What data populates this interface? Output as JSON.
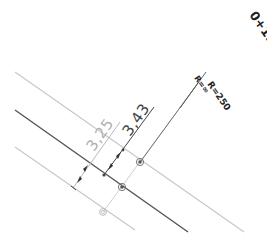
{
  "drawing": {
    "station_label": "0+118.293",
    "radius_left": "R=∞",
    "radius_right": "R=250",
    "dimension_outer": "3,25",
    "dimension_inner": "3,43"
  },
  "colors": {
    "background": "#ffffff",
    "centerline": "#555555",
    "edge_line": "#c8c8c8",
    "dim_light": "#b0b0b0",
    "dim_dark": "#444444",
    "text_dark": "#222222"
  }
}
